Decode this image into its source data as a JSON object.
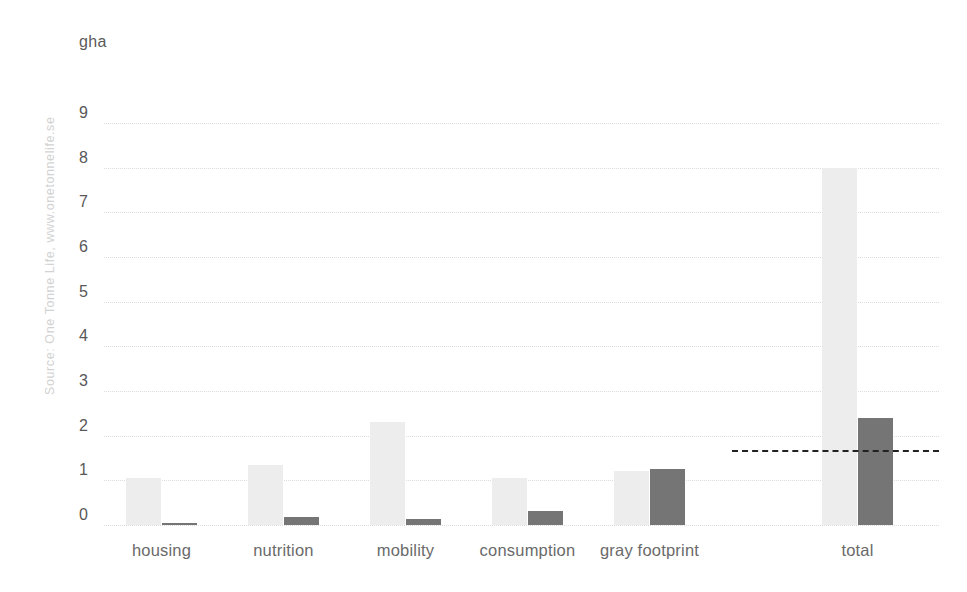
{
  "unit_label": "gha",
  "source_credit": "Source: One Tonne Life, www.onetonnelife.se",
  "chart_data": {
    "type": "bar",
    "title": "",
    "subtitle": "",
    "xlabel": "",
    "ylabel": "gha",
    "ylim": [
      0,
      9
    ],
    "yticks": [
      0,
      1,
      2,
      3,
      4,
      5,
      6,
      7,
      8,
      9
    ],
    "ytick_labels": [
      "0",
      "1",
      "2",
      "3",
      "4",
      "5",
      "6",
      "7",
      "8",
      "9"
    ],
    "grid": true,
    "legend_position": "none",
    "categories": [
      "housing",
      "nutrition",
      "mobility",
      "consumption",
      "gray footprint",
      "total"
    ],
    "series": [
      {
        "name": "light-series",
        "color": "#ededed",
        "values": [
          1.05,
          1.35,
          2.3,
          1.05,
          1.2,
          8.0
        ]
      },
      {
        "name": "dark-series",
        "color": "#757575",
        "values": [
          0.05,
          0.18,
          0.13,
          0.32,
          1.25,
          2.4
        ]
      }
    ],
    "annotations": [
      {
        "name": "reference-line",
        "type": "horizontal-dashed-line",
        "value": 1.68,
        "color": "#222222",
        "x_start_category": "gray footprint",
        "x_end_category": "total"
      }
    ]
  }
}
